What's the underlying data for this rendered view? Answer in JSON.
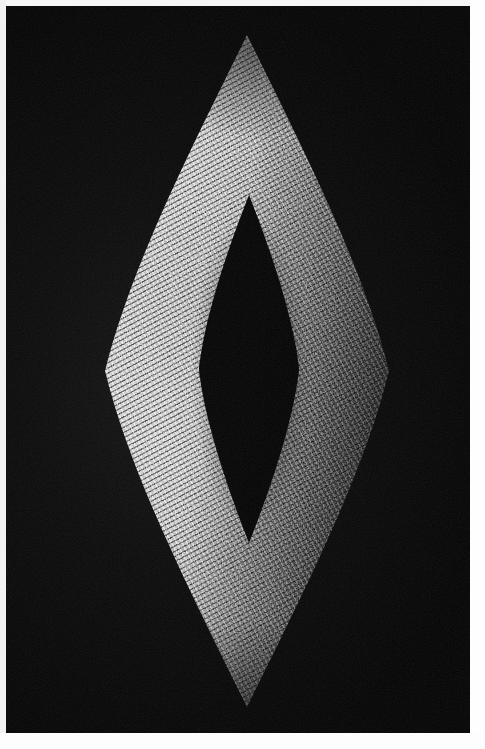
{
  "page": {
    "width": 485,
    "height": 749,
    "background_color": "#ffffff",
    "margin_color": "#fdfdfd"
  },
  "photograph": {
    "title": "",
    "caption": "",
    "background_color": "#050505",
    "subject": "grain-covered-lens-ring-sculpture",
    "orientation": "portrait",
    "lighting": "directional-from-left",
    "frame": {
      "x": 6,
      "y": 6,
      "width": 464,
      "height": 727
    }
  },
  "sculpture": {
    "name": "lens-ring-sculpture",
    "form": "vesica-piscis-ring",
    "surface_material": "rice-grains",
    "grain_color_light": "#e8e8e8",
    "grain_color_shadow": "#1a1a1a",
    "outer_bounds": {
      "x": 105,
      "y": 35,
      "width": 284,
      "height": 672
    },
    "inner_void": {
      "x": 199,
      "y": 195,
      "width": 100,
      "height": 348
    },
    "top_tip": {
      "x": 247,
      "y": 35
    },
    "bottom_tip": {
      "x": 247,
      "y": 707
    },
    "left_extreme": {
      "x": 105,
      "y": 371
    },
    "right_extreme": {
      "x": 389,
      "y": 371
    },
    "highlight_region": "left-center",
    "shadow_region": "upper-right"
  },
  "palette": {
    "black": "#050505",
    "deep_shadow": "#0a0a0a",
    "mid_grey": "#6f6f6f",
    "light_grey": "#b6b6b6",
    "highlight": "#efefef",
    "page_white": "#ffffff"
  }
}
